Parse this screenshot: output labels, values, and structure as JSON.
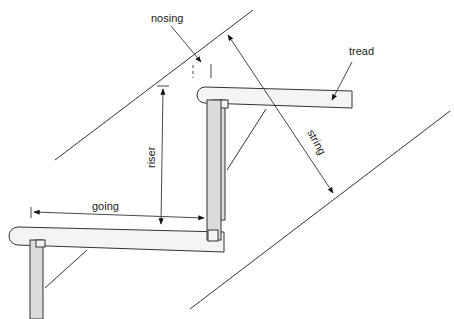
{
  "diagram": {
    "labels": {
      "nosing": "nosing",
      "tread": "tread",
      "riser": "riser",
      "string": "string",
      "going": "going"
    },
    "colors": {
      "line": "#333333",
      "riser_fill": "#dcdcdc",
      "tread_fill": "#f4f4f4",
      "background": "#ffffff"
    }
  }
}
